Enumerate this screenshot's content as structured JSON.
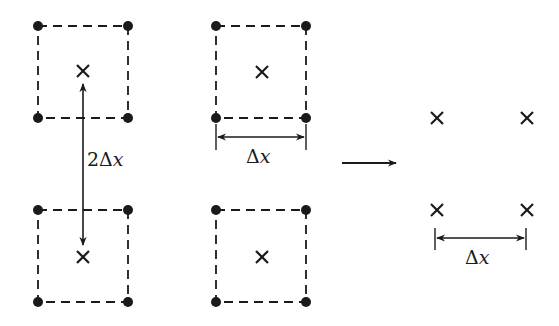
{
  "diagram": {
    "colors": {
      "ink": "#1a1a1a",
      "background": "#ffffff"
    },
    "cells": [
      {
        "id": "top-left",
        "corners": [
          [
            38,
            26
          ],
          [
            128,
            26
          ],
          [
            38,
            118
          ],
          [
            128,
            118
          ]
        ],
        "center": [
          83,
          71
        ]
      },
      {
        "id": "top-middle",
        "corners": [
          [
            216,
            26
          ],
          [
            306,
            26
          ],
          [
            216,
            118
          ],
          [
            306,
            118
          ]
        ],
        "center": [
          262,
          72
        ]
      },
      {
        "id": "bottom-left",
        "corners": [
          [
            38,
            210
          ],
          [
            128,
            210
          ],
          [
            38,
            302
          ],
          [
            128,
            302
          ]
        ],
        "center": [
          83,
          257
        ]
      },
      {
        "id": "bottom-middle",
        "corners": [
          [
            216,
            210
          ],
          [
            306,
            210
          ],
          [
            216,
            302
          ],
          [
            306,
            302
          ]
        ],
        "center": [
          262,
          257
        ]
      }
    ],
    "vertical_dimension": {
      "label_num": "2",
      "label_delta": "Δ",
      "label_var": "x",
      "x": 83,
      "y1": 84,
      "y2": 245
    },
    "cell_width_dimension": {
      "label_delta": "Δ",
      "label_var": "x",
      "x1": 216,
      "x2": 306,
      "y": 137
    },
    "transform_arrow": {
      "x1": 342,
      "x2": 396,
      "y": 163
    },
    "result_points": [
      [
        437,
        118
      ],
      [
        527,
        118
      ],
      [
        437,
        210
      ],
      [
        527,
        210
      ]
    ],
    "result_dimension": {
      "label_delta": "Δ",
      "label_var": "x",
      "x1": 435,
      "x2": 526,
      "y": 238
    }
  }
}
